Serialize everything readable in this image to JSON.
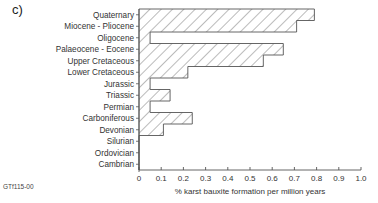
{
  "panel_label": "c)",
  "figure_code": "GTf115-00",
  "chart_data": {
    "type": "bar",
    "orientation": "horizontal",
    "title": "",
    "categories": [
      "Quaternary",
      "Miocene - Pliocene",
      "Oligocene",
      "Palaeocene - Eocene",
      "Upper Cretaceous",
      "Lower Cretaceous",
      "Jurassic",
      "Triassic",
      "Permian",
      "Carboniferous",
      "Devonian",
      "Silurian",
      "Ordovician",
      "Cambrian"
    ],
    "values": [
      0.79,
      0.71,
      0.05,
      0.65,
      0.56,
      0.22,
      0.05,
      0.14,
      0.05,
      0.24,
      0.11,
      0,
      0,
      0
    ],
    "xlabel": "% karst bauxite formation per million years",
    "ylabel": "",
    "xlim": [
      0,
      1.0
    ],
    "xticks": [
      "0",
      "0.1",
      "0.2",
      "0.3",
      "0.4",
      "0.5",
      "0.6",
      "0.7",
      "0.8",
      "0.9",
      "1.0"
    ],
    "grid": false,
    "legend": null,
    "fill": "diagonal hatch",
    "colors": {
      "outline": "#555555",
      "hatch": "#555555",
      "axis": "#555555",
      "text": "#333333"
    }
  }
}
